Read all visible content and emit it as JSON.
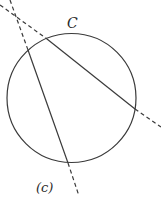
{
  "figure": {
    "curve_label": "C",
    "caption": "(c)",
    "colors": {
      "stroke": "#3a3a3a",
      "background": "#ffffff"
    },
    "circle": {
      "cx": 71.5,
      "cy": 98,
      "r": 64.5
    },
    "lines": [
      {
        "name": "secant-1",
        "solid": [
          [
            28,
            50
          ],
          [
            68,
            163
          ]
        ],
        "dashed": [
          [
            [
              10,
              0
            ],
            [
              28,
              50
            ]
          ],
          [
            [
              68,
              163
            ],
            [
              79,
              196
            ]
          ]
        ]
      },
      {
        "name": "secant-2",
        "solid": [
          [
            47,
            39
          ],
          [
            135,
            109
          ]
        ],
        "dashed": [
          [
            [
              0,
              5
            ],
            [
              47,
              39
            ]
          ],
          [
            [
              135,
              109
            ],
            [
              161,
              127
            ]
          ]
        ]
      }
    ]
  }
}
